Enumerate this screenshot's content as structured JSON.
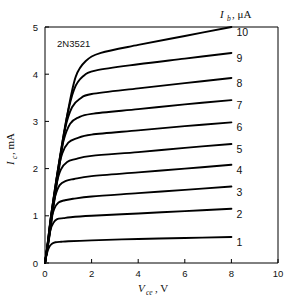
{
  "figure": {
    "device_label": "2N3521",
    "background_color": "#ffffff",
    "line_color": "#000000",
    "axis_color": "#000000"
  },
  "legend": {
    "title_symbol": "I",
    "title_subscript": "b",
    "title_unit": ", μA",
    "title_full": "I_b, μA",
    "position": "top-right"
  },
  "axes": {
    "x": {
      "symbol": "V",
      "subscript": "ce",
      "unit": ", V",
      "label_full": "V_ce, V",
      "ticks": [
        "0",
        "2",
        "4",
        "6",
        "8",
        "10"
      ],
      "tick_values": [
        0,
        2,
        4,
        6,
        8,
        10
      ],
      "min": 0,
      "max": 10
    },
    "y": {
      "symbol": "I",
      "subscript": "c",
      "unit": ", mA",
      "label_full": "I_c, mA",
      "ticks": [
        "0",
        "1",
        "2",
        "3",
        "4",
        "5"
      ],
      "tick_values": [
        0,
        1,
        2,
        3,
        4,
        5
      ],
      "min": 0,
      "max": 5
    }
  },
  "chart_data": {
    "type": "line",
    "title": "",
    "subtitle": "",
    "xlabel": "V_ce, V",
    "ylabel": "I_c, mA",
    "xlim": [
      0,
      10
    ],
    "ylim": [
      0,
      5
    ],
    "grid": false,
    "legend_position": "right-inline",
    "legend_title": "I_b, μA",
    "annotations": [
      "2N3521"
    ],
    "series": [
      {
        "name": "1",
        "ib_uA": 1,
        "label": "1",
        "knee_v": 0.35,
        "sat_current_ma": 0.44,
        "end_current_ma": 0.55,
        "x": [
          0,
          0.08,
          0.18,
          0.3,
          0.45,
          0.7,
          1.0,
          2.0,
          4.0,
          6.0,
          8.0
        ],
        "y": [
          0,
          0.2,
          0.34,
          0.41,
          0.44,
          0.45,
          0.46,
          0.48,
          0.51,
          0.53,
          0.55
        ]
      },
      {
        "name": "2",
        "ib_uA": 2,
        "label": "2",
        "knee_v": 0.42,
        "sat_current_ma": 0.93,
        "end_current_ma": 1.15,
        "x": [
          0,
          0.1,
          0.22,
          0.36,
          0.52,
          0.8,
          1.1,
          2.0,
          4.0,
          6.0,
          8.0
        ],
        "y": [
          0,
          0.34,
          0.68,
          0.85,
          0.93,
          0.95,
          0.97,
          1.0,
          1.05,
          1.1,
          1.15
        ]
      },
      {
        "name": "3",
        "ib_uA": 3,
        "label": "3",
        "knee_v": 0.48,
        "sat_current_ma": 1.3,
        "end_current_ma": 1.62,
        "x": [
          0,
          0.11,
          0.24,
          0.4,
          0.58,
          0.85,
          1.2,
          2.0,
          4.0,
          6.0,
          8.0
        ],
        "y": [
          0,
          0.4,
          0.88,
          1.15,
          1.28,
          1.33,
          1.36,
          1.41,
          1.48,
          1.55,
          1.62
        ]
      },
      {
        "name": "4",
        "ib_uA": 4,
        "label": "4",
        "knee_v": 0.53,
        "sat_current_ma": 1.72,
        "end_current_ma": 2.08,
        "x": [
          0,
          0.12,
          0.26,
          0.44,
          0.63,
          0.9,
          1.25,
          2.0,
          4.0,
          6.0,
          8.0
        ],
        "y": [
          0,
          0.44,
          1.0,
          1.42,
          1.65,
          1.74,
          1.78,
          1.84,
          1.92,
          2.0,
          2.08
        ]
      },
      {
        "name": "5",
        "ib_uA": 5,
        "label": "5",
        "knee_v": 0.58,
        "sat_current_ma": 2.13,
        "end_current_ma": 2.52,
        "x": [
          0,
          0.13,
          0.28,
          0.48,
          0.68,
          0.95,
          1.3,
          2.0,
          4.0,
          6.0,
          8.0
        ],
        "y": [
          0,
          0.46,
          1.08,
          1.65,
          1.98,
          2.14,
          2.2,
          2.27,
          2.35,
          2.44,
          2.52
        ]
      },
      {
        "name": "6",
        "ib_uA": 6,
        "label": "6",
        "knee_v": 0.62,
        "sat_current_ma": 2.55,
        "end_current_ma": 2.98,
        "x": [
          0,
          0.14,
          0.3,
          0.52,
          0.74,
          1.0,
          1.35,
          2.0,
          4.0,
          6.0,
          8.0
        ],
        "y": [
          0,
          0.48,
          1.14,
          1.85,
          2.32,
          2.55,
          2.64,
          2.72,
          2.81,
          2.9,
          2.98
        ]
      },
      {
        "name": "7",
        "ib_uA": 7,
        "label": "7",
        "knee_v": 0.67,
        "sat_current_ma": 2.97,
        "end_current_ma": 3.45,
        "x": [
          0,
          0.15,
          0.32,
          0.56,
          0.8,
          1.08,
          1.42,
          2.0,
          4.0,
          6.0,
          8.0
        ],
        "y": [
          0,
          0.5,
          1.18,
          2.0,
          2.6,
          2.95,
          3.08,
          3.16,
          3.26,
          3.36,
          3.45
        ]
      },
      {
        "name": "8",
        "ib_uA": 8,
        "label": "8",
        "knee_v": 0.72,
        "sat_current_ma": 3.4,
        "end_current_ma": 3.92,
        "x": [
          0,
          0.16,
          0.34,
          0.6,
          0.86,
          1.16,
          1.5,
          2.0,
          4.0,
          6.0,
          8.0
        ],
        "y": [
          0,
          0.51,
          1.2,
          2.12,
          2.85,
          3.3,
          3.48,
          3.58,
          3.7,
          3.81,
          3.92
        ]
      },
      {
        "name": "9",
        "ib_uA": 9,
        "label": "9",
        "knee_v": 0.78,
        "sat_current_ma": 3.85,
        "end_current_ma": 4.45,
        "x": [
          0,
          0.17,
          0.36,
          0.64,
          0.92,
          1.25,
          1.62,
          2.2,
          4.0,
          6.0,
          8.0
        ],
        "y": [
          0,
          0.52,
          1.22,
          2.2,
          3.05,
          3.68,
          3.95,
          4.08,
          4.21,
          4.33,
          4.45
        ]
      },
      {
        "name": "10",
        "ib_uA": 10,
        "label": "10",
        "knee_v": 0.85,
        "sat_current_ma": 4.25,
        "end_current_ma": 5.0,
        "x": [
          0,
          0.18,
          0.38,
          0.68,
          0.98,
          1.32,
          1.75,
          2.4,
          4.0,
          6.0,
          8.0
        ],
        "y": [
          0,
          0.53,
          1.24,
          2.26,
          3.2,
          3.95,
          4.28,
          4.45,
          4.62,
          4.81,
          5.0
        ]
      }
    ]
  }
}
